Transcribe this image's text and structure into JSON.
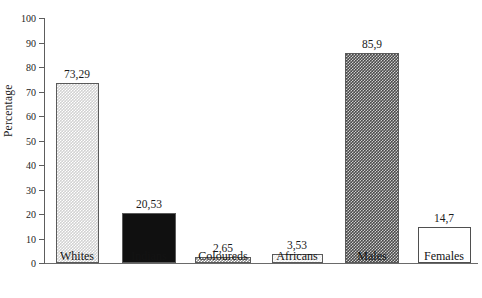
{
  "chart_data": {
    "type": "bar",
    "title": "",
    "xlabel": "",
    "ylabel": "Percentage",
    "ylim": [
      0,
      100
    ],
    "ytick_step": 10,
    "grid": false,
    "legend": "none",
    "decimal_separator": ",",
    "categories": [
      "Whites",
      "Indians",
      "Coloureds",
      "Africans",
      "Males",
      "Females"
    ],
    "values": [
      73.29,
      20.53,
      2.65,
      3.53,
      85.9,
      14.7
    ],
    "value_labels": [
      "73,29",
      "20,53",
      "2,65",
      "3,53",
      "85,9",
      "14,7"
    ],
    "bar_fills": [
      "light-check",
      "solid-black",
      "mid-check",
      "pale-dot",
      "dark-check",
      "white"
    ],
    "ytick_labels": [
      "0",
      "10",
      "20",
      "30",
      "40",
      "50",
      "60",
      "70",
      "80",
      "90",
      "100"
    ],
    "ytick_values": [
      0,
      10,
      20,
      30,
      40,
      50,
      60,
      70,
      80,
      90,
      100
    ],
    "bars": [
      {
        "category": "Whites",
        "value": 73.29,
        "label": "73,29",
        "fill": "light-check",
        "x_center": 77,
        "width": 43
      },
      {
        "category": "Indians",
        "value": 20.53,
        "label": "20,53",
        "fill": "solid-black",
        "x_center": 149,
        "width": 54
      },
      {
        "category": "Coloureds",
        "value": 2.65,
        "label": "2,65",
        "fill": "mid-check",
        "x_center": 223,
        "width": 56
      },
      {
        "category": "Africans",
        "value": 3.53,
        "label": "3,53",
        "fill": "pale-dot",
        "x_center": 297,
        "width": 51
      },
      {
        "category": "Males",
        "value": 85.9,
        "label": "85,9",
        "fill": "dark-check",
        "x_center": 372,
        "width": 54
      },
      {
        "category": "Females",
        "value": 14.7,
        "label": "14,7",
        "fill": "white",
        "x_center": 444,
        "width": 53
      }
    ],
    "colors": {
      "axis": "#5d5d5d",
      "text": "#1b1b1b",
      "background": "#ffffff"
    }
  }
}
